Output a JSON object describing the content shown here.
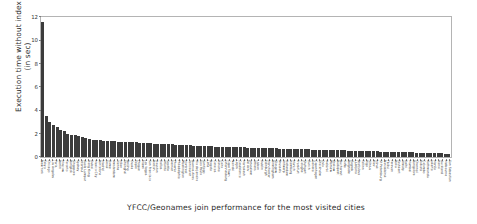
{
  "chart_data": {
    "type": "bar",
    "title": "",
    "xlabel": "YFCC/Geonames join performance for the most visited cities",
    "ylabel": "Execution time without index\n(in sec)",
    "ylabel_line1": "Execution time without index",
    "ylabel_line2": "(in sec)",
    "ylim": [
      0,
      12
    ],
    "yticks": [
      0,
      2,
      4,
      6,
      8,
      10,
      12
    ],
    "ytick_labels": [
      "0",
      "2",
      "4",
      "6",
      "8",
      "10",
      "12"
    ],
    "grid": false,
    "legend": false,
    "bar_color": "#3c3c3c",
    "categories": [
      "New York",
      "Tokyo",
      "Chicago",
      "Los Angeles",
      "Paris",
      "Berlin",
      "Moscow",
      "Toronto",
      "Bangkok",
      "Singapore",
      "Sydney",
      "Istanbul",
      "Kuala Lumpur",
      "Hong Kong",
      "Dubai",
      "Mexico City",
      "Barcelona",
      "Madrid",
      "Seoul",
      "Rome",
      "Amsterdam",
      "Vienna",
      "Milan",
      "Shanghai",
      "Beijing",
      "Osaka",
      "Taipei",
      "Prague",
      "Miami",
      "Las Vegas",
      "San Francisco",
      "Boston",
      "Houston",
      "Dallas",
      "Atlanta",
      "Seattle",
      "Denver",
      "Phoenix",
      "Philadelphia",
      "Washington",
      "Montreal",
      "Vancouver",
      "Buenos Aires",
      "Rio de Janeiro",
      "Sao Paulo",
      "Santiago",
      "Lima",
      "Bogota",
      "Caracas",
      "Havana",
      "Cairo",
      "Johannesburg",
      "Cape Town",
      "Nairobi",
      "Lagos",
      "Casablanca",
      "Marrakesh",
      "Tel Aviv",
      "Jerusalem",
      "Athens",
      "Lisbon",
      "Dublin",
      "Edinburgh",
      "Manchester",
      "Birmingham",
      "Glasgow",
      "Brussels",
      "Antwerp",
      "Rotterdam",
      "Hamburg",
      "Munich",
      "Frankfurt",
      "Cologne",
      "Stuttgart",
      "Zurich",
      "Geneva",
      "Copenhagen",
      "Stockholm",
      "Oslo",
      "Helsinki",
      "Warsaw",
      "Krakow",
      "Budapest",
      "Bucharest",
      "Sofia",
      "Belgrade",
      "Zagreb",
      "Ljubljana",
      "Bratislava",
      "Tallinn",
      "Riga",
      "Vilnius",
      "Kiev",
      "Minsk",
      "St Petersburg",
      "Novosibirsk",
      "Tbilisi",
      "Yerevan",
      "Baku",
      "Tashkent",
      "Almaty",
      "Delhi",
      "Mumbai",
      "Bangalore",
      "Chennai",
      "Kolkata",
      "Colombo",
      "Kathmandu",
      "Jakarta",
      "Manila",
      "Hanoi",
      "Auckland",
      "Melbourne",
      "San Sebastian"
    ],
    "values": [
      11.6,
      3.55,
      3.0,
      2.75,
      2.55,
      2.3,
      2.25,
      1.95,
      1.9,
      1.85,
      1.8,
      1.75,
      1.6,
      1.55,
      1.5,
      1.5,
      1.45,
      1.4,
      1.4,
      1.35,
      1.35,
      1.3,
      1.3,
      1.3,
      1.28,
      1.25,
      1.25,
      1.2,
      1.2,
      1.2,
      1.18,
      1.15,
      1.15,
      1.12,
      1.1,
      1.1,
      1.08,
      1.05,
      1.05,
      1.02,
      1.0,
      1.0,
      0.98,
      0.97,
      0.95,
      0.95,
      0.93,
      0.92,
      0.9,
      0.9,
      0.88,
      0.87,
      0.86,
      0.85,
      0.84,
      0.83,
      0.82,
      0.8,
      0.8,
      0.79,
      0.78,
      0.77,
      0.76,
      0.75,
      0.74,
      0.73,
      0.72,
      0.71,
      0.7,
      0.7,
      0.69,
      0.68,
      0.67,
      0.66,
      0.65,
      0.64,
      0.63,
      0.62,
      0.61,
      0.6,
      0.6,
      0.59,
      0.58,
      0.57,
      0.56,
      0.55,
      0.54,
      0.53,
      0.52,
      0.51,
      0.5,
      0.5,
      0.49,
      0.48,
      0.47,
      0.46,
      0.45,
      0.44,
      0.43,
      0.42,
      0.41,
      0.4,
      0.4,
      0.39,
      0.38,
      0.37,
      0.36,
      0.35,
      0.34,
      0.33,
      0.32,
      0.31,
      0.3,
      0.3
    ]
  }
}
